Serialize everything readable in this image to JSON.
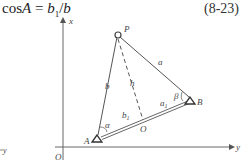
{
  "formula": {
    "lhs": "cos",
    "var": "A",
    "eq": " = ",
    "num": "b",
    "num_sub": "1",
    "slash": "/",
    "den": "b"
  },
  "equation_number": "(8-23)",
  "diagram": {
    "axis_x_label": "x",
    "axis_y_label": "y",
    "origin_label": "O",
    "left_fragment_label": "y",
    "points": {
      "P": "P",
      "A": "A",
      "B": "B",
      "O": "O"
    },
    "segments": {
      "a": "a",
      "b": "b",
      "h": "h",
      "a1": "a",
      "a1_sub": "1",
      "b1": "b",
      "b1_sub": "1"
    },
    "angles": {
      "alpha": "α",
      "beta": "β"
    },
    "colors": {
      "line": "#555555",
      "text": "#444444"
    }
  }
}
